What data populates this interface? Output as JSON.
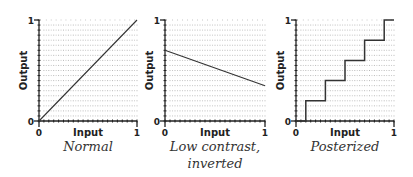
{
  "chart_data": [
    {
      "type": "line",
      "title": "Normal",
      "xlabel": "Input",
      "ylabel": "Output",
      "xlim": [
        0,
        1
      ],
      "ylim": [
        0,
        1
      ],
      "x_ticks": [
        "0",
        "1"
      ],
      "y_ticks": [
        "0",
        "1"
      ],
      "grid": true,
      "series": [
        {
          "name": "curve",
          "x": [
            0,
            1
          ],
          "y": [
            0,
            1
          ]
        }
      ]
    },
    {
      "type": "line",
      "title": "Low contrast, inverted",
      "xlabel": "Input",
      "ylabel": "Output",
      "xlim": [
        0,
        1
      ],
      "ylim": [
        0,
        1
      ],
      "x_ticks": [
        "0",
        "1"
      ],
      "y_ticks": [
        "0",
        "1"
      ],
      "grid": true,
      "series": [
        {
          "name": "curve",
          "x": [
            0,
            1
          ],
          "y": [
            0.7,
            0.35
          ]
        }
      ]
    },
    {
      "type": "line",
      "title": "Posterized",
      "xlabel": "Input",
      "ylabel": "Output",
      "xlim": [
        0,
        1
      ],
      "ylim": [
        0,
        1
      ],
      "x_ticks": [
        "0",
        "1"
      ],
      "y_ticks": [
        "0",
        "1"
      ],
      "grid": true,
      "series": [
        {
          "name": "curve",
          "x": [
            0,
            0.1,
            0.1,
            0.3,
            0.3,
            0.5,
            0.5,
            0.7,
            0.7,
            0.9,
            0.9,
            1
          ],
          "y": [
            0,
            0,
            0.2,
            0.2,
            0.4,
            0.4,
            0.6,
            0.6,
            0.8,
            0.8,
            1,
            1
          ]
        }
      ]
    }
  ],
  "captions": {
    "c1": "Normal",
    "c2_line1": "Low contrast,",
    "c2_line2": "inverted",
    "c3": "Posterized"
  },
  "labels": {
    "input": "Input",
    "output": "Output",
    "zero": "0",
    "one": "1"
  }
}
